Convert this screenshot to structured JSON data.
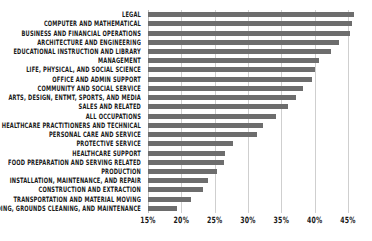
{
  "chart_data": {
    "type": "bar",
    "orientation": "horizontal",
    "title": "",
    "subtitle": "",
    "xlabel": "",
    "ylabel": "",
    "xlim": [
      15,
      46.5
    ],
    "xticks": [
      15,
      20,
      25,
      30,
      35,
      40,
      45
    ],
    "xtick_labels": [
      "15%",
      "20%",
      "25%",
      "30%",
      "35%",
      "40%",
      "45%"
    ],
    "grid": true,
    "legend": "none",
    "bar_color": "#6d6d6d",
    "gridline_color": "#cfcfcf",
    "categories": [
      "LEGAL",
      "COMPUTER AND MATHEMATICAL",
      "BUSINESS AND FINANCIAL OPERATIONS",
      "ARCHITECTURE AND ENGINEERING",
      "EDUCATIONAL INSTRUCTION AND LIBRARY",
      "MANAGEMENT",
      "LIFE, PHYSICAL, AND SOCIAL SCIENCE",
      "OFFICE AND ADMIN SUPPORT",
      "COMMUNITY AND SOCIAL SERVICE",
      "ARTS, DESIGN, ENTMT, SPORTS, AND MEDIA",
      "SALES AND RELATED",
      "ALL OCCUPATIONS",
      "HEALTHCARE PRACTITIONERS AND TECHNICAL",
      "PERSONAL CARE AND SERVICE",
      "PROTECTIVE SERVICE",
      "HEALTHCARE SUPPORT",
      "FOOD PREPARATION AND SERVING RELATED",
      "PRODUCTION",
      "INSTALLATION, MAINTENANCE, AND REPAIR",
      "CONSTRUCTION AND EXTRACTION",
      "TRANSPORTATION AND MATERIAL MOVING",
      "BUILDING, GROUNDS CLEANING, AND MAINTENANCE"
    ],
    "values": [
      45.9,
      45.6,
      45.3,
      43.6,
      42.4,
      40.7,
      40.0,
      39.6,
      38.2,
      37.2,
      36.0,
      34.2,
      32.2,
      31.4,
      27.7,
      26.5,
      26.4,
      25.4,
      24.0,
      23.3,
      21.5,
      19.3
    ]
  }
}
